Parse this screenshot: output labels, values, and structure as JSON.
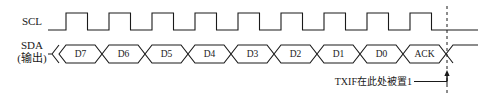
{
  "diagram": {
    "background_color": "#ffffff",
    "line_color": "#1a1a1a",
    "signals": [
      {
        "name": "scl",
        "label": "SCL",
        "type": "clock",
        "pulse_count": 9,
        "description": "Serial clock, 9 pulses, idles low before first pulse and after last falling edge"
      },
      {
        "name": "sda",
        "label_line1": "SDA",
        "label_line2": "(输出)",
        "type": "data-bus",
        "description": "Serial data output, hexagonal data cells"
      }
    ],
    "data_cells": [
      {
        "label": "D7"
      },
      {
        "label": "D6"
      },
      {
        "label": "D5"
      },
      {
        "label": "D4"
      },
      {
        "label": "D3"
      },
      {
        "label": "D2"
      },
      {
        "label": "D1"
      },
      {
        "label": "D0"
      },
      {
        "label": "ACK"
      }
    ],
    "annotation": {
      "text": "TXIF在此处被置1",
      "marker": "dashed-vertical-line-with-up-arrow",
      "points_at": "end-of-ACK-bit"
    }
  },
  "geometry": {
    "cell_period": 43,
    "first_edge_x": 66,
    "scl_high_y": 13,
    "scl_low_y": 30,
    "sda_top_y": 45,
    "sda_bottom_y": 63,
    "marker_x": 447
  }
}
